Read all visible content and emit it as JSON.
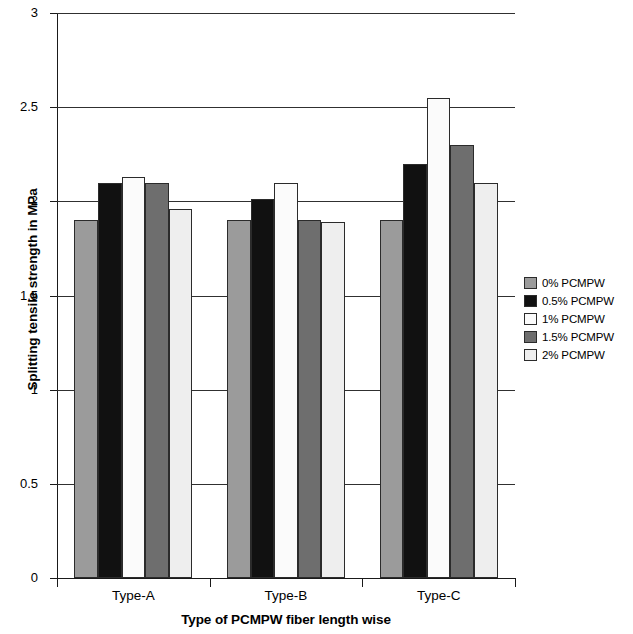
{
  "chart_data": {
    "type": "bar",
    "title": "",
    "subtitle": "",
    "xlabel": "Type of PCMPW fiber length wise",
    "ylabel": "Splitting tensile strength in MPa",
    "categories": [
      "Type-A",
      "Type-B",
      "Type-C"
    ],
    "series": [
      {
        "name": "0% PCMPW",
        "color": "#9b9b9b",
        "values": [
          1.9,
          1.9,
          1.9
        ]
      },
      {
        "name": "0.5% PCMPW",
        "color": "#111111",
        "values": [
          2.1,
          2.01,
          2.2
        ]
      },
      {
        "name": "1% PCMPW",
        "color": "#fbfbfb",
        "values": [
          2.13,
          2.1,
          2.55
        ]
      },
      {
        "name": "1.5% PCMPW",
        "color": "#6e6e6e",
        "values": [
          2.1,
          1.9,
          2.3
        ]
      },
      {
        "name": "2% PCMPW",
        "color": "#eeeeee",
        "values": [
          1.96,
          1.89,
          2.1
        ]
      }
    ],
    "ylim": [
      0,
      3
    ],
    "yticks": [
      0,
      0.5,
      1,
      1.5,
      2,
      2.5,
      3
    ],
    "ytick_labels": [
      "0",
      "0.5",
      "1",
      "1.5",
      "2",
      "2.5",
      "3"
    ],
    "grid": true,
    "grid_axis": "y",
    "legend_position": "right",
    "bar_edge_color": "#2b2b2b",
    "axis_color": "#1a1a1a"
  },
  "legend": {
    "items": [
      {
        "label": "0% PCMPW",
        "color": "#9b9b9b"
      },
      {
        "label": "0.5% PCMPW",
        "color": "#111111"
      },
      {
        "label": "1% PCMPW",
        "color": "#fbfbfb"
      },
      {
        "label": "1.5% PCMPW",
        "color": "#6e6e6e"
      },
      {
        "label": "2% PCMPW",
        "color": "#eeeeee"
      }
    ]
  }
}
